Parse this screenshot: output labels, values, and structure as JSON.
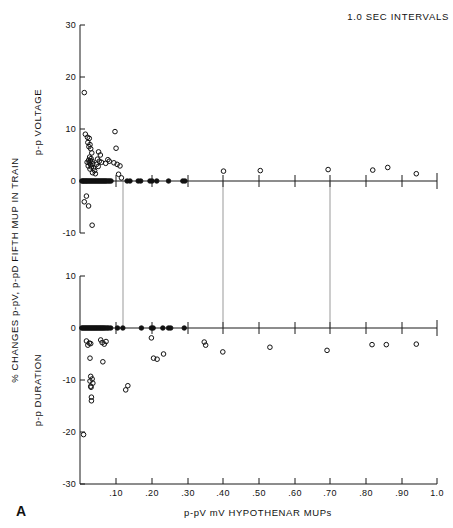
{
  "figure": {
    "panel_letter": "A",
    "annotation": "1.0 SEC INTERVALS",
    "y_axis_outer_label": "% CHANGES p-pV, p-pD FIFTH MUP IN TRAIN",
    "x_axis_label": "p-pV mV HYPOTHENAR MUPs",
    "upper_y_inner_label": "p-p VOLTAGE",
    "lower_y_inner_label": "p-p DURATION",
    "colors": {
      "ink": "#111111",
      "grid": "#555555",
      "background": "#ffffff"
    }
  },
  "chart_data": [
    {
      "type": "scatter",
      "title": "p-p VOLTAGE",
      "subtitle": "1.0 SEC INTERVALS",
      "xlabel": "p-pV mV HYPOTHENAR MUPs",
      "ylabel": "p-p VOLTAGE",
      "xlim": [
        0.0,
        1.0
      ],
      "ylim": [
        -10,
        30
      ],
      "xticks": [
        0.1,
        0.2,
        0.3,
        0.4,
        0.5,
        0.6,
        0.7,
        0.8,
        0.9,
        1.0
      ],
      "xticklabels": [
        ".10",
        ".20",
        ".30",
        ".40",
        ".50",
        ".60",
        ".70",
        ".80",
        ".90",
        "1.0"
      ],
      "yticks": [
        -10,
        0,
        10,
        20,
        30
      ],
      "yticklabels": [
        "-10",
        "0",
        "10",
        "20",
        "30"
      ],
      "grid": "vertical gridlines at x = .12, .40, .70",
      "gridlines_x": [
        0.12,
        0.4,
        0.7
      ],
      "legend": "none",
      "marker": "open circle",
      "points": [
        [
          0.012,
          17.0
        ],
        [
          0.015,
          9.0
        ],
        [
          0.021,
          8.4
        ],
        [
          0.026,
          8.2
        ],
        [
          0.022,
          7.4
        ],
        [
          0.028,
          7.0
        ],
        [
          0.025,
          6.6
        ],
        [
          0.03,
          6.2
        ],
        [
          0.033,
          5.4
        ],
        [
          0.027,
          4.6
        ],
        [
          0.031,
          4.3
        ],
        [
          0.024,
          4.0
        ],
        [
          0.029,
          3.9
        ],
        [
          0.034,
          3.8
        ],
        [
          0.02,
          3.6
        ],
        [
          0.026,
          3.5
        ],
        [
          0.036,
          3.3
        ],
        [
          0.03,
          3.1
        ],
        [
          0.023,
          2.9
        ],
        [
          0.032,
          2.7
        ],
        [
          0.038,
          2.5
        ],
        [
          0.028,
          2.3
        ],
        [
          0.041,
          2.0
        ],
        [
          0.035,
          1.6
        ],
        [
          0.052,
          5.6
        ],
        [
          0.057,
          5.0
        ],
        [
          0.049,
          4.2
        ],
        [
          0.054,
          3.8
        ],
        [
          0.06,
          3.6
        ],
        [
          0.046,
          3.2
        ],
        [
          0.051,
          2.8
        ],
        [
          0.043,
          1.4
        ],
        [
          0.072,
          3.4
        ],
        [
          0.078,
          4.1
        ],
        [
          0.082,
          3.8
        ],
        [
          0.098,
          9.5
        ],
        [
          0.101,
          6.3
        ],
        [
          0.095,
          3.5
        ],
        [
          0.104,
          3.2
        ],
        [
          0.112,
          2.9
        ],
        [
          0.108,
          1.3
        ],
        [
          0.116,
          0.6
        ],
        [
          0.005,
          0.0
        ],
        [
          0.008,
          0.0
        ],
        [
          0.01,
          0.0
        ],
        [
          0.013,
          0.0
        ],
        [
          0.016,
          0.0
        ],
        [
          0.018,
          0.0
        ],
        [
          0.021,
          0.0
        ],
        [
          0.024,
          0.0
        ],
        [
          0.027,
          0.0
        ],
        [
          0.03,
          0.0
        ],
        [
          0.033,
          0.0
        ],
        [
          0.036,
          0.0
        ],
        [
          0.039,
          0.0
        ],
        [
          0.042,
          0.0
        ],
        [
          0.045,
          0.0
        ],
        [
          0.048,
          0.0
        ],
        [
          0.051,
          0.0
        ],
        [
          0.054,
          0.0
        ],
        [
          0.057,
          0.0
        ],
        [
          0.06,
          0.0
        ],
        [
          0.063,
          0.0
        ],
        [
          0.066,
          0.0
        ],
        [
          0.069,
          0.0
        ],
        [
          0.072,
          0.0
        ],
        [
          0.075,
          0.0
        ],
        [
          0.079,
          0.0
        ],
        [
          0.083,
          0.0
        ],
        [
          0.087,
          0.0
        ],
        [
          0.132,
          0.0
        ],
        [
          0.14,
          0.0
        ],
        [
          0.163,
          0.0
        ],
        [
          0.17,
          0.0
        ],
        [
          0.196,
          0.0
        ],
        [
          0.202,
          0.0
        ],
        [
          0.215,
          0.0
        ],
        [
          0.248,
          0.0
        ],
        [
          0.288,
          0.0
        ],
        [
          0.294,
          0.0
        ],
        [
          0.402,
          1.9
        ],
        [
          0.505,
          2.0
        ],
        [
          0.695,
          2.2
        ],
        [
          0.82,
          2.1
        ],
        [
          0.862,
          2.6
        ],
        [
          0.942,
          1.4
        ],
        [
          0.018,
          -2.9
        ],
        [
          0.012,
          -4.0
        ],
        [
          0.024,
          -4.8
        ],
        [
          0.034,
          -8.5
        ]
      ]
    },
    {
      "type": "scatter",
      "title": "p-p DURATION",
      "xlabel": "p-pV mV HYPOTHENAR MUPs",
      "ylabel": "p-p DURATION",
      "xlim": [
        0.0,
        1.0
      ],
      "ylim": [
        -30,
        10
      ],
      "xticks": [
        0.1,
        0.2,
        0.3,
        0.4,
        0.5,
        0.6,
        0.7,
        0.8,
        0.9,
        1.0
      ],
      "xticklabels": [
        ".10",
        ".20",
        ".30",
        ".40",
        ".50",
        ".60",
        ".70",
        ".80",
        ".90",
        "1.0"
      ],
      "yticks": [
        -30,
        -20,
        -10,
        0,
        10
      ],
      "yticklabels": [
        "-30",
        "-20",
        "-10",
        "0",
        "10"
      ],
      "grid": "vertical gridlines at x = .12, .40, .70",
      "gridlines_x": [
        0.12,
        0.4,
        0.7
      ],
      "legend": "none",
      "marker": "open circle",
      "points": [
        [
          0.005,
          0.0
        ],
        [
          0.008,
          0.0
        ],
        [
          0.011,
          0.0
        ],
        [
          0.014,
          0.0
        ],
        [
          0.017,
          0.0
        ],
        [
          0.02,
          0.0
        ],
        [
          0.023,
          0.0
        ],
        [
          0.026,
          0.0
        ],
        [
          0.029,
          0.0
        ],
        [
          0.032,
          0.0
        ],
        [
          0.035,
          0.0
        ],
        [
          0.038,
          0.0
        ],
        [
          0.041,
          0.0
        ],
        [
          0.044,
          0.0
        ],
        [
          0.047,
          0.0
        ],
        [
          0.05,
          0.0
        ],
        [
          0.053,
          0.0
        ],
        [
          0.056,
          0.0
        ],
        [
          0.059,
          0.0
        ],
        [
          0.062,
          0.0
        ],
        [
          0.065,
          0.0
        ],
        [
          0.068,
          0.0
        ],
        [
          0.072,
          0.0
        ],
        [
          0.076,
          0.0
        ],
        [
          0.08,
          0.0
        ],
        [
          0.086,
          0.0
        ],
        [
          0.105,
          0.0
        ],
        [
          0.12,
          0.0
        ],
        [
          0.172,
          0.0
        ],
        [
          0.2,
          0.0
        ],
        [
          0.205,
          0.0
        ],
        [
          0.232,
          0.0
        ],
        [
          0.248,
          0.0
        ],
        [
          0.254,
          0.0
        ],
        [
          0.292,
          0.0
        ],
        [
          0.018,
          -2.5
        ],
        [
          0.026,
          -2.9
        ],
        [
          0.022,
          -3.3
        ],
        [
          0.03,
          -3.0
        ],
        [
          0.058,
          -2.3
        ],
        [
          0.062,
          -2.8
        ],
        [
          0.068,
          -3.1
        ],
        [
          0.073,
          -2.6
        ],
        [
          0.028,
          -5.8
        ],
        [
          0.064,
          -6.5
        ],
        [
          0.2,
          -1.9
        ],
        [
          0.206,
          -5.8
        ],
        [
          0.216,
          -6.0
        ],
        [
          0.234,
          -5.0
        ],
        [
          0.348,
          -2.7
        ],
        [
          0.352,
          -3.3
        ],
        [
          0.4,
          -4.6
        ],
        [
          0.532,
          -3.7
        ],
        [
          0.692,
          -4.3
        ],
        [
          0.818,
          -3.2
        ],
        [
          0.858,
          -3.2
        ],
        [
          0.942,
          -3.1
        ],
        [
          0.03,
          -9.3
        ],
        [
          0.034,
          -9.8
        ],
        [
          0.028,
          -10.2
        ],
        [
          0.036,
          -10.6
        ],
        [
          0.03,
          -11.2
        ],
        [
          0.031,
          -11.4
        ],
        [
          0.032,
          -13.3
        ],
        [
          0.032,
          -14.0
        ],
        [
          0.128,
          -11.9
        ],
        [
          0.134,
          -11.1
        ],
        [
          0.01,
          -20.5
        ]
      ]
    }
  ]
}
